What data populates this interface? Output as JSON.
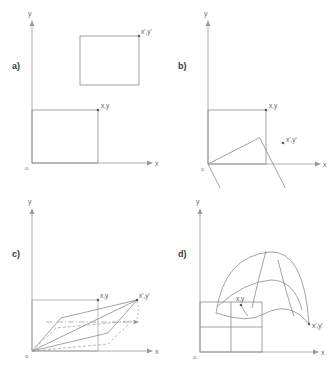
{
  "figure": {
    "width": 332,
    "height": 376,
    "caption": "",
    "stroke_color": "#8a8a8a",
    "axis_color": "#9a9a9a",
    "label_color": "#5a5a5a"
  },
  "axes": {
    "x_label": "x",
    "y_label": "y",
    "origin_label": "o"
  },
  "point_labels": {
    "source": "x,y",
    "target": "x',y'"
  },
  "panels": [
    {
      "id": "a",
      "letter": "a)",
      "name": "translation",
      "source_square": {
        "x": 32,
        "y": 110,
        "w": 66,
        "h": 53
      },
      "target_square": {
        "x": 80,
        "y": 36,
        "w": 59,
        "h": 49
      },
      "source_point": {
        "x": 98,
        "y": 110
      },
      "target_point": {
        "x": 139,
        "y": 36
      }
    },
    {
      "id": "b",
      "letter": "b)",
      "name": "rotation",
      "source_square": {
        "x": 208,
        "y": 110,
        "w": 58,
        "h": 54
      },
      "rotation_deg": -27,
      "source_point": {
        "x": 266,
        "y": 110
      },
      "target_point": {
        "x": 283,
        "y": 143
      }
    },
    {
      "id": "c",
      "letter": "c)",
      "name": "affine-shear",
      "source_square": {
        "x": 32,
        "y": 300,
        "w": 66,
        "h": 51
      },
      "source_point": {
        "x": 98,
        "y": 300
      },
      "target_point": {
        "x": 137,
        "y": 297
      }
    },
    {
      "id": "d",
      "letter": "d)",
      "name": "warp-perspective",
      "source_square": {
        "x": 200,
        "y": 313,
        "w": 62,
        "h": 50
      },
      "source_point": {
        "x": 241,
        "y": 325
      },
      "target_point": {
        "x": 310,
        "y": 344
      }
    }
  ]
}
